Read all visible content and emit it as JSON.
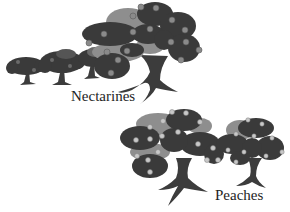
{
  "illustration": {
    "style": "grayscale clip-art",
    "background": "#ffffff",
    "colors": {
      "canopy_dark": "#3a3a3a",
      "canopy_mid": "#555555",
      "canopy_light": "#8e8e8e",
      "fruit": "#8a8a8a",
      "fruit_light": "#c8c8c8",
      "trunk": "#3c3c3c"
    },
    "groups": [
      {
        "name": "nectarines",
        "label": "Nectarines",
        "tree_count": 4,
        "description": "Row of three small trees leading to one large tree with grey fruit"
      },
      {
        "name": "peaches",
        "label": "Peaches",
        "tree_count": 2,
        "description": "One large tree and one smaller tree with light-colored fruit"
      }
    ]
  }
}
